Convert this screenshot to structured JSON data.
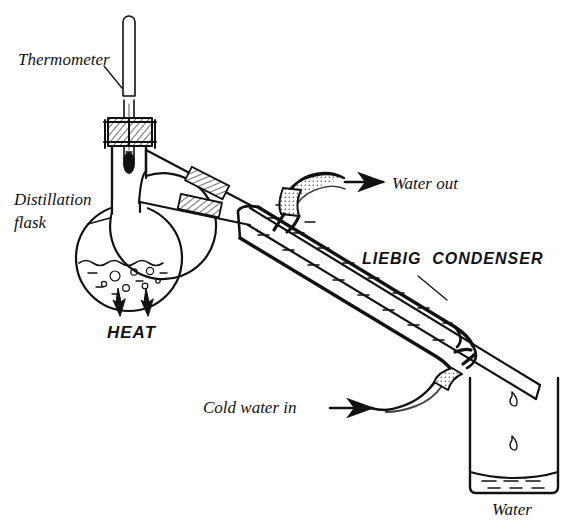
{
  "figure": {
    "stroke_color": "#111111",
    "background_color": "#ffffff"
  },
  "labels": {
    "thermometer": "Thermometer",
    "distillation_flask_line1": "Distillation",
    "distillation_flask_line2": "flask",
    "heat": "HEAT",
    "water_out": "Water out",
    "liebig_condenser": "LIEBIG  CONDENSER",
    "cold_water_in": "Cold water in",
    "water": "Water"
  },
  "parts": {
    "thermometer": {
      "name": "thermometer",
      "description": "vertical glass thermometer with bulb inserted through stopper"
    },
    "stopper": {
      "name": "ground-glass-stopper",
      "description": "hatched stopper at flask neck holding thermometer"
    },
    "flask": {
      "name": "round-bottom-distillation-flask",
      "description": "round bottom flask with boiling liquid and bubbles"
    },
    "liquid": {
      "name": "boiling-liquid",
      "description": "wavy liquid surface with rising bubbles"
    },
    "heat_source": {
      "name": "heat-arrows",
      "count": 2,
      "description": "two flame arrows pointing up at flask base"
    },
    "side_arm": {
      "name": "side-arm-tube",
      "description": "angled delivery tube from flask neck to condenser"
    },
    "joint_clips": {
      "name": "ground-glass-joint-clips",
      "count": 2,
      "description": "two hatched joint collars on the side arm"
    },
    "condenser": {
      "name": "liebig-condenser",
      "description": "inclined double-wall water jacket with inner tube"
    },
    "water_out_hose": {
      "name": "water-outlet-hose",
      "description": "upper hose at top of jacket with arrow pointing away"
    },
    "water_in_hose": {
      "name": "water-inlet-hose",
      "description": "lower hose at bottom of jacket with arrow pointing in"
    },
    "beaker": {
      "name": "receiving-beaker",
      "description": "beaker collecting distillate, shallow liquid at base"
    },
    "droplets": {
      "name": "distillate-droplets",
      "count": 2,
      "description": "two drops falling from condenser tip into beaker"
    }
  },
  "arrows": {
    "water_out_direction": "right",
    "cold_water_in_direction": "right",
    "heat_direction": "up"
  }
}
